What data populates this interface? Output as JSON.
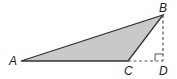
{
  "diagram": {
    "colors": {
      "fill": "#c9c9c9",
      "stroke": "#333333",
      "dash": "#555555"
    },
    "points": {
      "A": {
        "label": "A",
        "x": 21,
        "y": 61
      },
      "B": {
        "label": "B",
        "x": 163,
        "y": 15
      },
      "C": {
        "label": "C",
        "x": 128,
        "y": 61
      },
      "D": {
        "label": "D",
        "x": 163,
        "y": 61
      }
    },
    "triangle": [
      "A",
      "B",
      "C"
    ],
    "dashed_segments": [
      [
        "B",
        "D"
      ],
      [
        "C",
        "D"
      ]
    ],
    "right_angle_at": "D"
  }
}
